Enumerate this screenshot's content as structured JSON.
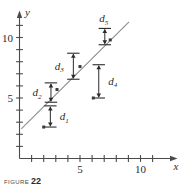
{
  "figure": {
    "caption_word": "FIGURE",
    "caption_number": "22"
  },
  "axes": {
    "x_name": "x",
    "y_name": "y",
    "x_tick_labels": [
      {
        "value": 5,
        "text": "5"
      },
      {
        "value": 10,
        "text": "10"
      }
    ],
    "y_tick_labels": [
      {
        "value": 5,
        "text": "5"
      },
      {
        "value": 10,
        "text": "10"
      }
    ],
    "axis_color": "#4a4a4a"
  },
  "chart_data": {
    "type": "scatter",
    "title": "",
    "xlabel": "x",
    "ylabel": "y",
    "xlim": [
      0,
      11.6
    ],
    "ylim": [
      0,
      11.6
    ],
    "grid": false,
    "legend": "none",
    "x_ticks": [
      1,
      2,
      3,
      4,
      5,
      6,
      7,
      8,
      9,
      10,
      11
    ],
    "y_ticks": [
      1,
      2,
      3,
      4,
      5,
      6,
      7,
      8,
      9,
      10,
      11
    ],
    "x_tick_labels_shown": [
      "5",
      "10"
    ],
    "y_tick_labels_shown": [
      "5",
      "10"
    ],
    "points": [
      {
        "label": "P1",
        "x": 2.0,
        "y": 2.6
      },
      {
        "label": "P2",
        "x": 3.1,
        "y": 5.7
      },
      {
        "label": "P3",
        "x": 5.0,
        "y": 7.6
      },
      {
        "label": "P4",
        "x": 6.1,
        "y": 5.0
      },
      {
        "label": "P5",
        "x": 7.5,
        "y": 9.8
      }
    ],
    "line": {
      "name": "least-squares regression line",
      "x_start": 0.15,
      "y_start": 2.45,
      "x_end": 9.05,
      "y_end": 11.3,
      "color": "#8c8c8c"
    },
    "residual_markers": [
      {
        "name": "d1",
        "label": "d",
        "subscript": "1",
        "x": 2.55,
        "y_top": 4.35,
        "y_bottom": 2.6,
        "label_side": "right"
      },
      {
        "name": "d2",
        "label": "d",
        "subscript": "2",
        "x": 2.6,
        "y_top": 6.25,
        "y_bottom": 4.65,
        "label_side": "left"
      },
      {
        "name": "d3",
        "label": "d",
        "subscript": "3",
        "x": 4.45,
        "y_top": 8.7,
        "y_bottom": 6.55,
        "label_side": "left"
      },
      {
        "name": "d4",
        "label": "d",
        "subscript": "4",
        "x": 6.55,
        "y_top": 7.75,
        "y_bottom": 5.0,
        "label_side": "right"
      },
      {
        "name": "d5",
        "label": "d",
        "subscript": "5",
        "x": 7.05,
        "y_top": 10.75,
        "y_bottom": 9.4,
        "label_side": "above"
      }
    ]
  }
}
